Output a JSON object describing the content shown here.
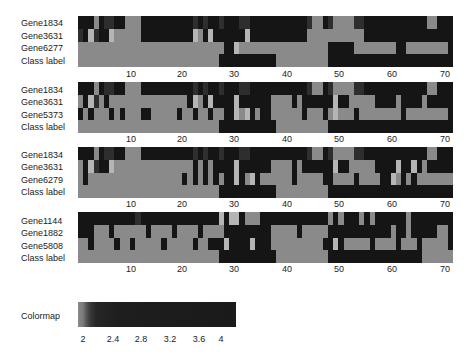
{
  "chart_data": [
    {
      "type": "heatmap",
      "title": "",
      "rows": [
        "Gene1834",
        "Gene3631",
        "Gene6277",
        "Class label"
      ],
      "x_ticks": [
        10,
        20,
        30,
        40,
        50,
        60,
        70
      ],
      "n_columns": 72,
      "levels": [
        "000301100333000000000010100100011000000000001330133331100000000000033000",
        "104100433333000000000043040000004000000000003333333333300000000000000000",
        "333333333333333333333333333300433333333333333333000003333333300333333330",
        "333333333333333333333333333000000000003333333333000000000000000000000000"
      ]
    },
    {
      "type": "heatmap",
      "title": "",
      "rows": [
        "Gene1834",
        "Gene3631",
        "Gene5373",
        "Class label"
      ],
      "x_ticks": [
        10,
        20,
        30,
        40,
        50,
        60,
        70
      ],
      "n_columns": 72,
      "levels": [
        "000301100333000000000010100100011000000000001330133331100000000000033000",
        "304130333333333333333043040000400000033330300000040033333000030000300000",
        "030333030333003333303303303300434030033333303330343330333333330333333330",
        "333333333333333333333333333000000000003333333333000000000000000000000000"
      ]
    },
    {
      "type": "heatmap",
      "title": "",
      "rows": [
        "Gene1834",
        "Gene3631",
        "Gene6279",
        "Class label"
      ],
      "x_ticks": [
        10,
        20,
        30,
        40,
        50,
        60,
        70
      ],
      "n_columns": 72,
      "levels": [
        "000301100333000000000010100100011000000000001330133331100000000000033000",
        "304100433333333333333303030000400000033330300000040033333000040040300000",
        "303333333333333333330303030300403403333330333330033330333300430303333333",
        "333333333333333333333333333000000000003333333333000000000000000000000000"
      ]
    },
    {
      "type": "heatmap",
      "title": "",
      "rows": [
        "Gene1144",
        "Gene1882",
        "Gene5808",
        "Class label"
      ],
      "x_ticks": [
        10,
        20,
        30,
        40,
        50,
        60,
        70
      ],
      "n_columns": 72,
      "levels": [
        "000000000001000000000000000404403330000000000000303000303000000300000000",
        "000333033333303333033330333300000000033333033333000000000000300300000330",
        "330333303303333303333303300040000400033333333330040333330333303330333330",
        "333333333333333333333333333000000000003333333333000000000000000000333333"
      ]
    },
    {
      "type": "heatmap",
      "title": "Colormap",
      "colorbar": true,
      "ticks": [
        2,
        2.4,
        2.8,
        3.2,
        3.6,
        4
      ],
      "range": [
        2,
        4
      ]
    }
  ],
  "palette": [
    "#151515",
    "#2e2e2e",
    "#5c5c5c",
    "#8a8a8a",
    "#b5b5b5"
  ],
  "panels": [
    {
      "rows": [
        "Gene1834",
        "Gene3631",
        "Gene6277",
        "Class label"
      ],
      "ticks": [
        "10",
        "20",
        "30",
        "40",
        "50",
        "60",
        "70"
      ]
    },
    {
      "rows": [
        "Gene1834",
        "Gene3631",
        "Gene5373",
        "Class label"
      ],
      "ticks": [
        "10",
        "20",
        "30",
        "40",
        "50",
        "60",
        "70"
      ]
    },
    {
      "rows": [
        "Gene1834",
        "Gene3631",
        "Gene6279",
        "Class label"
      ],
      "ticks": [
        "10",
        "20",
        "30",
        "40",
        "50",
        "60",
        "70"
      ]
    },
    {
      "rows": [
        "Gene1144",
        "Gene1882",
        "Gene5808",
        "Class label"
      ],
      "ticks": [
        "10",
        "20",
        "30",
        "40",
        "50",
        "60",
        "70"
      ]
    }
  ],
  "colormap": {
    "label": "Colormap",
    "ticks": [
      "2",
      "2.4",
      "2.8",
      "3.2",
      "3.6",
      "4"
    ]
  }
}
